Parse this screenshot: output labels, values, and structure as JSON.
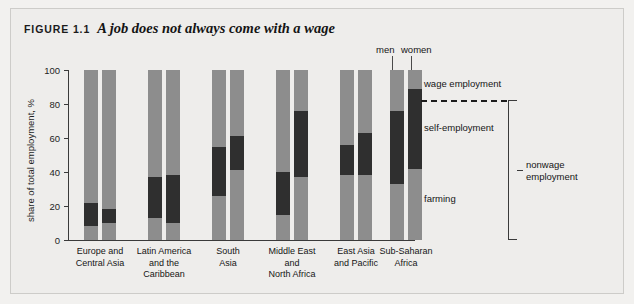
{
  "figure": {
    "label": "FIGURE 1.1",
    "headline": "A job does not always come with a wage"
  },
  "callouts": {
    "men": "men",
    "women": "women"
  },
  "annotations": {
    "wage_employment": "wage employment",
    "self_employment": "self-employment",
    "farming": "farming",
    "nonwage_line1": "nonwage",
    "nonwage_line2": "employment"
  },
  "colors": {
    "gray": "#8d8d8d",
    "dark": "#2f2f2f",
    "background": "#eeedeb",
    "axis": "#3a3a3a",
    "text": "#151515"
  },
  "chart_data": {
    "type": "bar",
    "subtype": "stacked-grouped",
    "title": "A job does not always come with a wage",
    "xlabel": "",
    "ylabel": "share of total employment, %",
    "ylim": [
      0,
      100
    ],
    "yticks": [
      0,
      20,
      40,
      60,
      80,
      100
    ],
    "ytick_labels": [
      "0",
      "20",
      "40",
      "60",
      "80",
      "100"
    ],
    "grid": false,
    "legend": [
      "farming",
      "self-employment",
      "wage employment"
    ],
    "legend_position": "right-annotations",
    "group_labels": [
      "men",
      "women"
    ],
    "categories": [
      "Europe and Central Asia",
      "Latin America and the Caribbean",
      "South Asia",
      "Middle East and North Africa",
      "East Asia and Pacific",
      "Sub-Saharan Africa"
    ],
    "category_lines": [
      [
        "Europe and",
        "Central Asia"
      ],
      [
        "Latin America",
        "and the",
        "Caribbean"
      ],
      [
        "South",
        "Asia"
      ],
      [
        "Middle East",
        "and",
        "North Africa"
      ],
      [
        "East Asia",
        "and Pacific"
      ],
      [
        "Sub-Saharan",
        "Africa"
      ]
    ],
    "series": [
      {
        "name": "farming",
        "men": [
          8,
          13,
          26,
          15,
          38,
          33
        ],
        "women": [
          10,
          10,
          41,
          37,
          38,
          42
        ]
      },
      {
        "name": "self-employment",
        "men": [
          14,
          24,
          29,
          25,
          18,
          43
        ],
        "women": [
          8,
          28,
          20,
          39,
          25,
          47
        ]
      },
      {
        "name": "wage employment",
        "men": [
          78,
          63,
          45,
          60,
          44,
          24
        ],
        "women": [
          82,
          62,
          39,
          24,
          37,
          11
        ]
      }
    ],
    "bars": [
      {
        "category": "Europe and Central Asia",
        "group": "men",
        "farming_top": 8,
        "self_top": 22
      },
      {
        "category": "Europe and Central Asia",
        "group": "women",
        "farming_top": 10,
        "self_top": 18
      },
      {
        "category": "Latin America and the Caribbean",
        "group": "men",
        "farming_top": 13,
        "self_top": 37
      },
      {
        "category": "Latin America and the Caribbean",
        "group": "women",
        "farming_top": 10,
        "self_top": 38
      },
      {
        "category": "South Asia",
        "group": "men",
        "farming_top": 26,
        "self_top": 55
      },
      {
        "category": "South Asia",
        "group": "women",
        "farming_top": 41,
        "self_top": 61
      },
      {
        "category": "Middle East and North Africa",
        "group": "men",
        "farming_top": 15,
        "self_top": 40
      },
      {
        "category": "Middle East and North Africa",
        "group": "women",
        "farming_top": 37,
        "self_top": 76
      },
      {
        "category": "East Asia and Pacific",
        "group": "men",
        "farming_top": 38,
        "self_top": 56
      },
      {
        "category": "East Asia and Pacific",
        "group": "women",
        "farming_top": 38,
        "self_top": 63
      },
      {
        "category": "Sub-Saharan Africa",
        "group": "men",
        "farming_top": 33,
        "self_top": 76
      },
      {
        "category": "Sub-Saharan Africa",
        "group": "women",
        "farming_top": 42,
        "self_top": 89
      }
    ]
  }
}
